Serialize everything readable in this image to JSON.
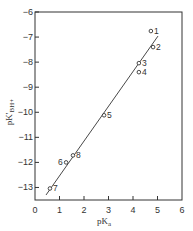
{
  "chart_data": {
    "type": "scatter",
    "title": "",
    "xlabel": "pKa",
    "xlabel_main": "pK",
    "xlabel_sub": "a",
    "ylabel": "pK'BH+",
    "ylabel_main": "pK'",
    "ylabel_sub": "BH+",
    "xlim": [
      0,
      6
    ],
    "ylim": [
      -13.5,
      -6
    ],
    "xticks": [
      0,
      1,
      2,
      3,
      4,
      5,
      6
    ],
    "yticks": [
      -6,
      -7,
      -8,
      -9,
      -10,
      -11,
      -12,
      -13
    ],
    "grid": false,
    "legend": null,
    "points": [
      {
        "label": "1",
        "x": 4.73,
        "y": -6.76
      },
      {
        "label": "2",
        "x": 4.82,
        "y": -7.4
      },
      {
        "label": "3",
        "x": 4.24,
        "y": -8.04
      },
      {
        "label": "4",
        "x": 4.24,
        "y": -8.4
      },
      {
        "label": "5",
        "x": 2.82,
        "y": -10.12
      },
      {
        "label": "6",
        "x": 1.27,
        "y": -12.0
      },
      {
        "label": "7",
        "x": 0.61,
        "y": -13.04
      },
      {
        "label": "8",
        "x": 1.55,
        "y": -11.72
      }
    ],
    "fit_line": {
      "x1": 0.45,
      "y1": -13.3,
      "x2": 5.02,
      "y2": -6.96
    }
  },
  "colors": {
    "ink": "#333333",
    "background": "#ffffff"
  }
}
